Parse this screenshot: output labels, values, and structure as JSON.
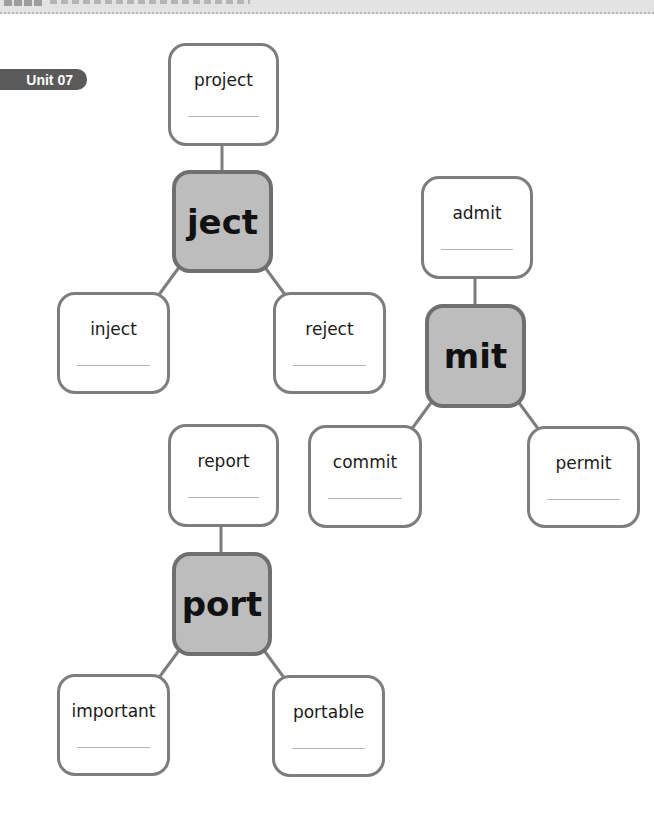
{
  "header": {
    "unit_label": "Unit 07"
  },
  "colors": {
    "box_border": "#7d7d7d",
    "root_fill": "#bdbdbd",
    "root_border": "#6f6f6f",
    "badge_fill": "#5a5a5a"
  },
  "trees": [
    {
      "root": "ject",
      "words": {
        "top": "project",
        "left": "inject",
        "right": "reject"
      }
    },
    {
      "root": "mit",
      "words": {
        "top": "admit",
        "left": "commit",
        "right": "permit"
      }
    },
    {
      "root": "port",
      "words": {
        "top": "report",
        "left": "important",
        "right": "portable"
      }
    }
  ]
}
